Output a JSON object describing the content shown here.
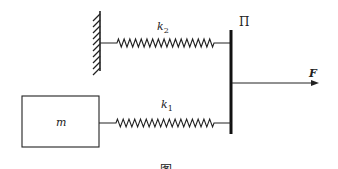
{
  "diagram": {
    "labels": {
      "spring_upper": "k",
      "spring_upper_sub": "2",
      "spring_lower": "k",
      "spring_lower_sub": "1",
      "plate": "Π",
      "force": "F",
      "mass": "m",
      "caption_partial": "图"
    },
    "elements": [
      {
        "id": "wall",
        "type": "fixed-support"
      },
      {
        "id": "spring-k2",
        "type": "spring",
        "connects": [
          "wall",
          "plate"
        ]
      },
      {
        "id": "plate",
        "type": "rigid-plate",
        "label": "Π"
      },
      {
        "id": "force-F",
        "type": "force-arrow",
        "direction": "right",
        "applied_to": "plate"
      },
      {
        "id": "mass",
        "type": "block",
        "label": "m"
      },
      {
        "id": "spring-k1",
        "type": "spring",
        "connects": [
          "mass",
          "plate"
        ]
      }
    ],
    "colors": {
      "stroke": "#222222",
      "background": "#ffffff"
    }
  }
}
